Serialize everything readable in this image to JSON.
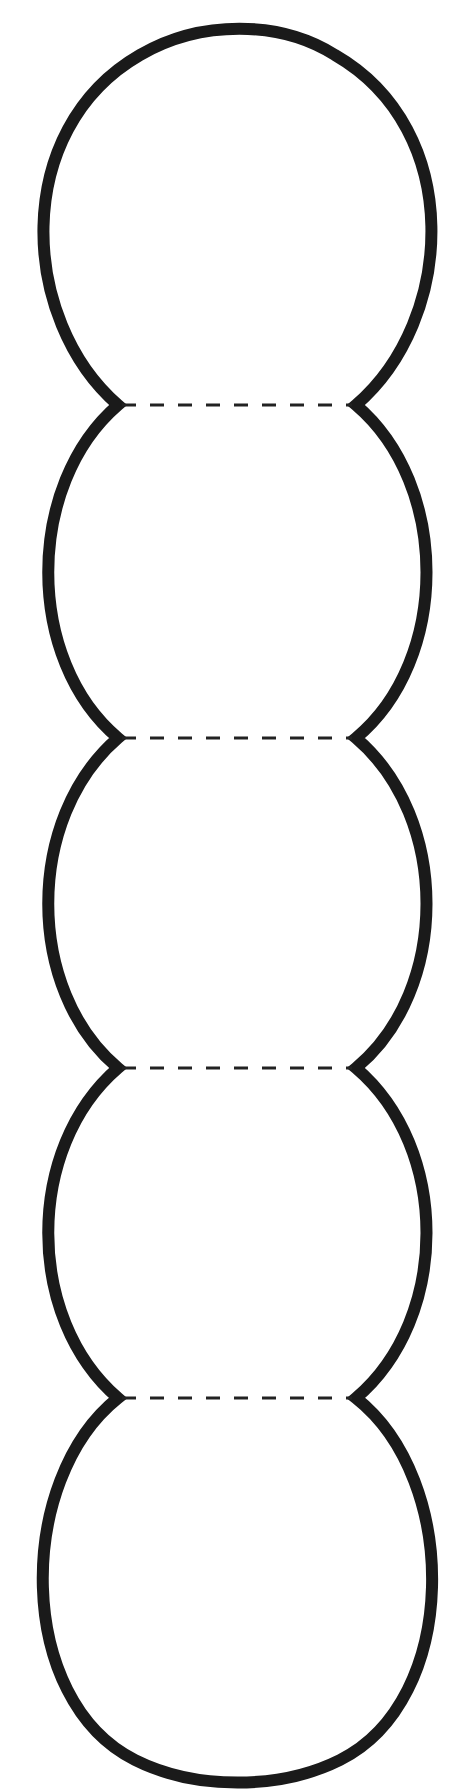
{
  "diagram": {
    "type": "template-outline",
    "segment_count": 5,
    "fold_lines": [
      {
        "y": 405,
        "x1": 118,
        "x2": 356
      },
      {
        "y": 738,
        "x1": 118,
        "x2": 356
      },
      {
        "y": 1068,
        "x1": 118,
        "x2": 356
      },
      {
        "y": 1398,
        "x1": 118,
        "x2": 356
      }
    ],
    "outline_color": "#1a1a1a",
    "fold_line_color": "#222222",
    "background_color": "#ffffff"
  }
}
